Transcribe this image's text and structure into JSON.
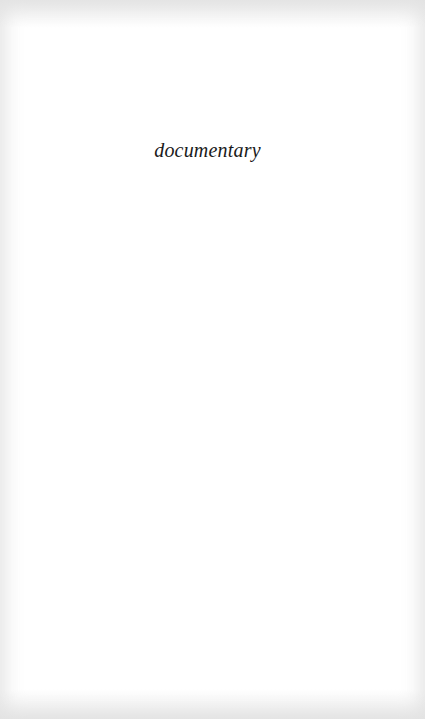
{
  "page": {
    "half_title": "documentary"
  }
}
